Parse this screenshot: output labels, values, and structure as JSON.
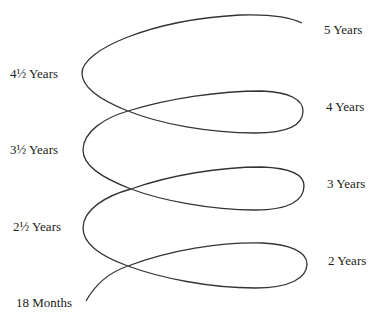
{
  "diagram": {
    "type": "developmental spiral",
    "stroke_color": "#333333",
    "left_labels": [
      {
        "text": "4½ Years",
        "x": 10,
        "y": 66
      },
      {
        "text": "3½ Years",
        "x": 10,
        "y": 142
      },
      {
        "text": "2½ Years",
        "x": 13,
        "y": 219
      },
      {
        "text": "18 Months",
        "x": 16,
        "y": 295
      }
    ],
    "right_labels": [
      {
        "text": "5 Years",
        "x": 324,
        "y": 22
      },
      {
        "text": "4 Years",
        "x": 326,
        "y": 99
      },
      {
        "text": "3 Years",
        "x": 327,
        "y": 176
      },
      {
        "text": "2 Years",
        "x": 328,
        "y": 253
      }
    ]
  }
}
